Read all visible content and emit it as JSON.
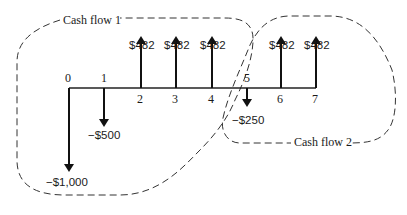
{
  "diagram": {
    "type": "cash-flow-timeline",
    "regions": [
      {
        "id": "cf1",
        "label": "Cash flow 1",
        "periods": [
          0,
          1,
          2,
          3,
          4
        ]
      },
      {
        "id": "cf2",
        "label": "Cash flow 2",
        "periods": [
          5,
          6,
          7
        ]
      }
    ],
    "periods": [
      {
        "t": "0",
        "amount_label": "−$1,000",
        "value": -1000
      },
      {
        "t": "1",
        "amount_label": "−$500",
        "value": -500
      },
      {
        "t": "2",
        "amount_label": "$482",
        "value": 482
      },
      {
        "t": "3",
        "amount_label": "$482",
        "value": 482
      },
      {
        "t": "4",
        "amount_label": "$482",
        "value": 482
      },
      {
        "t": "5",
        "amount_label": "−$250",
        "value": -250
      },
      {
        "t": "6",
        "amount_label": "$482",
        "value": 482
      },
      {
        "t": "7",
        "amount_label": "$482",
        "value": 482
      }
    ]
  }
}
